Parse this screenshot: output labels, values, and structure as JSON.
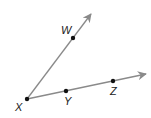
{
  "diagram": {
    "type": "geometry-rays",
    "colors": {
      "ray": "#8a8a8a",
      "point": "#111111",
      "label": "#222222"
    },
    "rays": [
      {
        "name": "ray-XW",
        "from": "X",
        "through": "W",
        "tip": [
          91,
          14
        ]
      },
      {
        "name": "ray-XZ",
        "from": "X",
        "through": "Z",
        "tip": [
          146,
          74
        ]
      }
    ],
    "points": [
      {
        "id": "X",
        "label": "X",
        "pos": [
          27,
          99
        ],
        "label_pos": [
          15,
          111
        ]
      },
      {
        "id": "W",
        "label": "W",
        "pos": [
          73,
          38
        ],
        "label_pos": [
          61,
          34
        ]
      },
      {
        "id": "Y",
        "label": "Y",
        "pos": [
          66,
          91
        ],
        "label_pos": [
          64,
          105
        ]
      },
      {
        "id": "Z",
        "label": "Z",
        "pos": [
          113,
          81
        ],
        "label_pos": [
          110,
          95
        ]
      }
    ]
  }
}
